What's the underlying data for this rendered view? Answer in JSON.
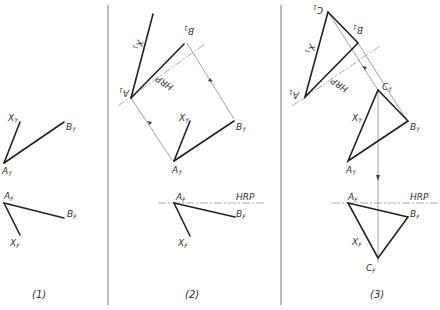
{
  "figure": {
    "panels": [
      {
        "caption": "(1)",
        "top_view": {
          "a": "A",
          "a_sub": "T",
          "b": "B",
          "b_sub": "T",
          "x": "X",
          "x_sub": "T"
        },
        "front_view": {
          "a": "A",
          "a_sub": "F",
          "b": "B",
          "b_sub": "F",
          "x": "X",
          "x_sub": "F"
        }
      },
      {
        "caption": "(2)",
        "aux_view": {
          "a": "A",
          "a_sub": "1",
          "b": "B",
          "b_sub": "1",
          "x": "X",
          "x_sub": "1",
          "plane": "HRP"
        },
        "top_view": {
          "a": "A",
          "a_sub": "T",
          "b": "B",
          "b_sub": "T",
          "x": "X",
          "x_sub": "T"
        },
        "front_view": {
          "a": "A",
          "a_sub": "F",
          "b": "B",
          "b_sub": "F",
          "x": "X",
          "x_sub": "F",
          "plane": "HRP"
        }
      },
      {
        "caption": "(3)",
        "aux_view": {
          "a": "A",
          "a_sub": "1",
          "b": "B",
          "b_sub": "1",
          "c": "C",
          "c_sub": "1",
          "x": "X",
          "x_sub": "1",
          "plane": "HRP"
        },
        "top_view": {
          "a": "A",
          "a_sub": "T",
          "b": "B",
          "b_sub": "T",
          "c": "C",
          "c_sub": "T",
          "x": "X",
          "x_sub": "T"
        },
        "front_view": {
          "a": "A",
          "a_sub": "F",
          "b": "B",
          "b_sub": "F",
          "c": "C",
          "c_sub": "F",
          "x": "X",
          "x_sub": "F",
          "plane": "HRP"
        }
      }
    ]
  }
}
